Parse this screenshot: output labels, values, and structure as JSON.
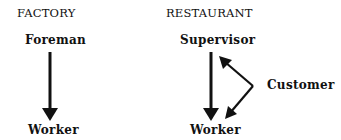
{
  "factory": {
    "heading": "FACTORY",
    "top_node": "Foreman",
    "bottom_node": "Worker"
  },
  "restaurant": {
    "heading": "RESTAURANT",
    "top_node": "Supervisor",
    "bottom_node": "Worker",
    "side_node": "Customer"
  },
  "colors": {
    "ink": "#111111",
    "background": "#ffffff"
  }
}
